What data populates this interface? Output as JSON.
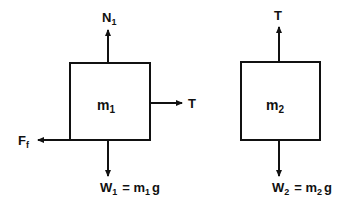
{
  "diagram": {
    "type": "free-body diagrams",
    "bodies": [
      {
        "id": "block1",
        "label": "m",
        "label_sub": "1",
        "forces": {
          "normal": {
            "label": "N",
            "sub": "1",
            "direction": "up"
          },
          "tension": {
            "label": "T",
            "direction": "right"
          },
          "friction": {
            "label": "F",
            "sub": "f",
            "direction": "left"
          },
          "weight": {
            "label": "W",
            "sub": "1",
            "eq": "= m",
            "eq_sub": "1",
            "tail": "g",
            "direction": "down"
          }
        }
      },
      {
        "id": "block2",
        "label": "m",
        "label_sub": "2",
        "forces": {
          "tension": {
            "label": "T",
            "direction": "up"
          },
          "weight": {
            "label": "W",
            "sub": "2",
            "eq": "= m",
            "eq_sub": "2",
            "tail": "g",
            "direction": "down"
          }
        }
      }
    ],
    "colors": {
      "line": "#111111",
      "background": "#ffffff"
    }
  }
}
